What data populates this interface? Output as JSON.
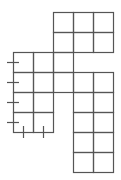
{
  "diagram": {
    "type": "grid-net",
    "line_color": "#555555",
    "background": "#ffffff",
    "cell_size": 20,
    "cells": [
      {
        "col": 2,
        "row": 0
      },
      {
        "col": 3,
        "row": 0
      },
      {
        "col": 4,
        "row": 0
      },
      {
        "col": 2,
        "row": 1
      },
      {
        "col": 3,
        "row": 1
      },
      {
        "col": 4,
        "row": 1
      },
      {
        "col": 0,
        "row": 2
      },
      {
        "col": 1,
        "row": 2
      },
      {
        "col": 2,
        "row": 2
      },
      {
        "col": 0,
        "row": 3
      },
      {
        "col": 1,
        "row": 3
      },
      {
        "col": 2,
        "row": 3
      },
      {
        "col": 3,
        "row": 3
      },
      {
        "col": 4,
        "row": 3
      },
      {
        "col": 0,
        "row": 4
      },
      {
        "col": 1,
        "row": 4
      },
      {
        "col": 3,
        "row": 4
      },
      {
        "col": 4,
        "row": 4
      },
      {
        "col": 0,
        "row": 5
      },
      {
        "col": 1,
        "row": 5
      },
      {
        "col": 3,
        "row": 5
      },
      {
        "col": 4,
        "row": 5
      },
      {
        "col": 3,
        "row": 6
      },
      {
        "col": 4,
        "row": 6
      },
      {
        "col": 3,
        "row": 7
      },
      {
        "col": 4,
        "row": 7
      }
    ],
    "left_ticks_y": [
      62,
      82,
      102,
      122
    ],
    "bottom_ticks_x": [
      23,
      43
    ]
  }
}
